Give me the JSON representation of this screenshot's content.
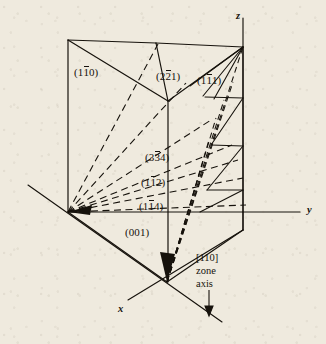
{
  "figure": {
    "background_color": "#efeade",
    "ink_color": "#16120c"
  },
  "axes": [
    {
      "name": "z-axis",
      "label": "z",
      "x": 236,
      "y": 10
    },
    {
      "name": "y-axis",
      "label": "y",
      "x": 307,
      "y": 211
    },
    {
      "name": "x-axis",
      "label": "x",
      "x": 118,
      "y": 310
    }
  ],
  "plane_labels": [
    {
      "name": "plane-1bar10",
      "pre": "(1",
      "bar": "1",
      "post": "0)",
      "x": 74,
      "y": 66
    },
    {
      "name": "plane-2bar21",
      "pre": "(2",
      "bar": "2",
      "post": "1)",
      "x": 156,
      "y": 70
    },
    {
      "name": "plane-1bar11",
      "pre": "(1",
      "bar": "1",
      "post": "1)",
      "x": 197,
      "y": 74
    },
    {
      "name": "plane-3bar34",
      "pre": "(3",
      "bar": "3",
      "post": "4)",
      "x": 145,
      "y": 151
    },
    {
      "name": "plane-1bar12",
      "pre": "(1",
      "bar": "1",
      "post": "2)",
      "x": 141,
      "y": 176
    },
    {
      "name": "plane-1bar14",
      "pre": "(1",
      "bar": "1",
      "post": "4)",
      "x": 139,
      "y": 200
    },
    {
      "name": "plane-001",
      "pre": "(001)",
      "bar": "",
      "post": "",
      "x": 125,
      "y": 226
    }
  ],
  "zone_axis": {
    "line1": "[110]",
    "line2": "zone",
    "line3": "axis",
    "x": 196,
    "y": 251
  }
}
